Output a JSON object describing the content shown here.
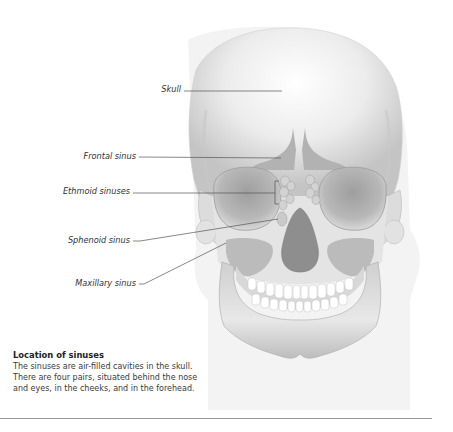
{
  "diagram": {
    "title": "Location of sinuses",
    "labels": [
      {
        "id": "skull",
        "text": "Skull"
      },
      {
        "id": "frontal",
        "text": "Frontal sinus"
      },
      {
        "id": "ethmoid",
        "text": "Ethmoid sinuses"
      },
      {
        "id": "sphenoid",
        "text": "Sphenoid sinus"
      },
      {
        "id": "maxillary",
        "text": "Maxillary sinus"
      }
    ],
    "colors": {
      "bone_light": "#f4f4f4",
      "bone_mid": "#d6d6d6",
      "bone_dark": "#a8a8a8",
      "cavity": "#8e8e8e",
      "leader_line": "#555555"
    }
  },
  "caption": {
    "title": "Location of sinuses",
    "body": "The sinuses are air-filled cavities in the skull. There are four pairs, situated behind the nose and eyes, in the cheeks, and in the forehead."
  }
}
